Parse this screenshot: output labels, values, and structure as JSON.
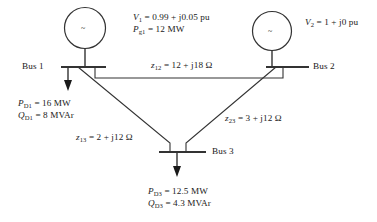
{
  "diagram": {
    "type": "power-system-one-line",
    "stroke_color": "#333333",
    "text_color": "#1a1a1a",
    "background": "#ffffff",
    "generators": [
      {
        "id": "g1",
        "symbol": "~",
        "bus": "Bus 1"
      },
      {
        "id": "g2",
        "symbol": "~",
        "bus": "Bus 2"
      }
    ],
    "buses": [
      {
        "id": "bus1",
        "label": "Bus 1"
      },
      {
        "id": "bus2",
        "label": "Bus 2"
      },
      {
        "id": "bus3",
        "label": "Bus 3"
      }
    ],
    "gen1_specs": {
      "voltage_var": "V",
      "voltage_sub": "1",
      "voltage_value": "= 0.99 + j0.05 pu",
      "power_var": "P",
      "power_sub": "g1",
      "power_value": "= 12 MW"
    },
    "gen2_specs": {
      "voltage_var": "V",
      "voltage_sub": "2",
      "voltage_value": "= 1 + j0 pu"
    },
    "impedances": [
      {
        "id": "z12",
        "var": "z",
        "sub": "12",
        "value": "= 12 + j18 Ω"
      },
      {
        "id": "z13",
        "var": "z",
        "sub": "13",
        "value": "= 2 + j12 Ω"
      },
      {
        "id": "z23",
        "var": "z",
        "sub": "23",
        "value": "= 3 + j12 Ω"
      }
    ],
    "load1": {
      "p_var": "P",
      "p_sub": "D1",
      "p_value": "= 16 MW",
      "q_var": "Q",
      "q_sub": "D1",
      "q_value": "= 8 MVAr"
    },
    "load3": {
      "p_var": "P",
      "p_sub": "D3",
      "p_value": "= 12.5 MW",
      "q_var": "Q",
      "q_sub": "D3",
      "q_value": "= 4.3 MVAr"
    }
  }
}
